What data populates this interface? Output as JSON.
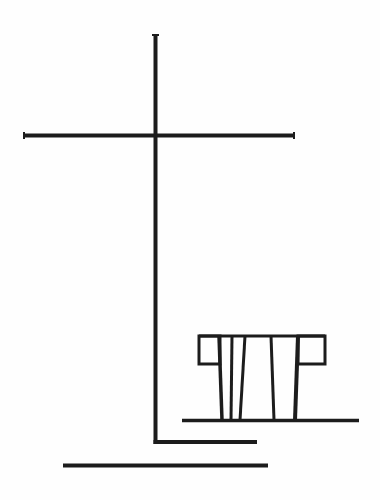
{
  "canvas": {
    "width": 380,
    "height": 500,
    "background": "#fefefe",
    "ink": "#1c1c1c"
  },
  "drawing": {
    "subject": "line-drawing-cross-with-structure",
    "cross": {
      "vertical": {
        "x": 155.5,
        "y1": 34,
        "y2": 444,
        "stroke": 4
      },
      "crossbar": {
        "y": 135.5,
        "x1": 23,
        "x2": 295,
        "stroke": 4
      },
      "foot": {
        "y": 442,
        "x1": 153.5,
        "x2": 257,
        "stroke": 4
      }
    },
    "base_line": {
      "y": 465.5,
      "x1": 63,
      "x2": 268,
      "stroke": 4
    },
    "ground_line": {
      "y": 420.5,
      "x1": 182,
      "x2": 359,
      "stroke": 3.5
    },
    "structure": {
      "top_bar": {
        "y": 336,
        "x1": 199,
        "x2": 325,
        "stroke": 3
      },
      "left_block": {
        "x1": 199,
        "y1": 336,
        "x2": 220,
        "y2": 364,
        "stroke": 3
      },
      "right_block": {
        "x1": 298,
        "y1": 336,
        "x2": 325,
        "y2": 364,
        "stroke": 3
      },
      "strokes": [
        {
          "x1": 219,
          "y1": 336,
          "x2": 222,
          "y2": 420,
          "w": 3.5
        },
        {
          "x1": 232,
          "y1": 336,
          "x2": 231,
          "y2": 420,
          "w": 3
        },
        {
          "x1": 245,
          "y1": 336,
          "x2": 240,
          "y2": 420,
          "w": 3
        },
        {
          "x1": 271,
          "y1": 336,
          "x2": 274,
          "y2": 420,
          "w": 3
        },
        {
          "x1": 298,
          "y1": 336,
          "x2": 295,
          "y2": 420,
          "w": 4
        }
      ]
    }
  }
}
